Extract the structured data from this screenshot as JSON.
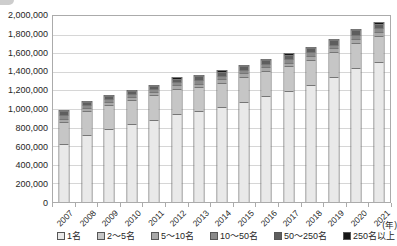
{
  "chart_data": {
    "type": "bar",
    "stacked": true,
    "title": "",
    "xlabel": "",
    "ylabel": "",
    "x_unit_label": "(年)",
    "categories": [
      "2007",
      "2008",
      "2009",
      "2010",
      "2011",
      "2012",
      "2013",
      "2014",
      "2015",
      "2016",
      "2017",
      "2018",
      "2019",
      "2020",
      "2021"
    ],
    "series": [
      {
        "name": "1名",
        "color": "#e9e9e9",
        "values": [
          620000,
          720000,
          785000,
          835000,
          885000,
          945000,
          975000,
          1025000,
          1080000,
          1140000,
          1190000,
          1255000,
          1340000,
          1445000,
          1505000
        ]
      },
      {
        "name": "2〜5名",
        "color": "#c6c6c6",
        "values": [
          240000,
          255000,
          255000,
          260000,
          265000,
          270000,
          260000,
          260000,
          265000,
          270000,
          270000,
          275000,
          275000,
          270000,
          280000
        ]
      },
      {
        "name": "5〜10名",
        "color": "#a8a8a8",
        "values": [
          35000,
          35000,
          35000,
          35000,
          35000,
          38000,
          38000,
          38000,
          38000,
          40000,
          40000,
          40000,
          40000,
          42000,
          42000
        ]
      },
      {
        "name": "10〜50名",
        "color": "#8a8a8a",
        "values": [
          40000,
          30000,
          30000,
          30000,
          30000,
          35000,
          35000,
          35000,
          35000,
          35000,
          38000,
          38000,
          38000,
          40000,
          40000
        ]
      },
      {
        "name": "50〜250名",
        "color": "#5e5e5e",
        "values": [
          40000,
          35000,
          35000,
          35000,
          35000,
          40000,
          42000,
          42000,
          42000,
          42000,
          45000,
          45000,
          45000,
          48000,
          50000
        ]
      },
      {
        "name": "250名以上",
        "color": "#161616",
        "values": [
          12000,
          12000,
          13000,
          13000,
          13000,
          15000,
          15000,
          15000,
          15000,
          15000,
          15000,
          16000,
          16000,
          18000,
          18000
        ]
      }
    ],
    "ylim": [
      0,
      2000000
    ],
    "ytick_step": 200000,
    "yticklabels": [
      "0",
      "200,000",
      "400,000",
      "600,000",
      "800,000",
      "1,000,000",
      "1,200,000",
      "1,400,000",
      "1,600,000",
      "1,800,000",
      "2,000,000"
    ],
    "grid": true,
    "legend_position": "bottom",
    "bar_outline_color": "#767676"
  }
}
